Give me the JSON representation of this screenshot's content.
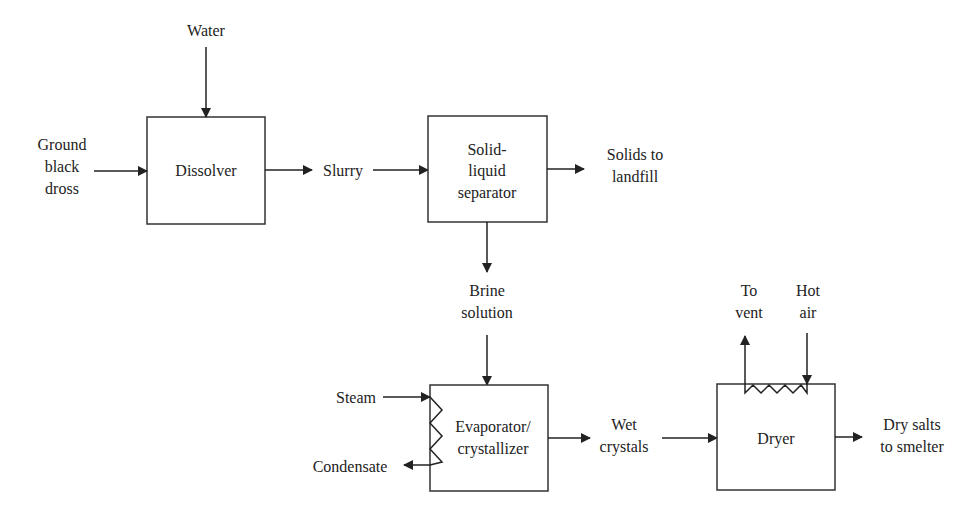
{
  "diagram": {
    "type": "process-flow",
    "units": {
      "dissolver": "Dissolver",
      "separator": [
        "Solid-",
        "liquid",
        "separator"
      ],
      "evaporator": [
        "Evaporator/",
        "crystallizer"
      ],
      "dryer": "Dryer"
    },
    "streams": {
      "water": "Water",
      "ground_black_dross": [
        "Ground",
        "black",
        "dross"
      ],
      "slurry": "Slurry",
      "solids_to_landfill": [
        "Solids to",
        "landfill"
      ],
      "brine_solution": [
        "Brine",
        "solution"
      ],
      "steam": "Steam",
      "condensate": "Condensate",
      "wet_crystals": [
        "Wet",
        "crystals"
      ],
      "to_vent": [
        "To",
        "vent"
      ],
      "hot_air": [
        "Hot",
        "air"
      ],
      "dry_salts": [
        "Dry salts",
        "to smelter"
      ]
    },
    "edges": [
      {
        "from": "Water",
        "to": "Dissolver"
      },
      {
        "from": "Ground black dross",
        "to": "Dissolver"
      },
      {
        "from": "Dissolver",
        "to": "Slurry"
      },
      {
        "from": "Slurry",
        "to": "Solid-liquid separator"
      },
      {
        "from": "Solid-liquid separator",
        "to": "Solids to landfill"
      },
      {
        "from": "Solid-liquid separator",
        "to": "Brine solution"
      },
      {
        "from": "Brine solution",
        "to": "Evaporator/crystallizer"
      },
      {
        "from": "Steam",
        "to": "Evaporator/crystallizer"
      },
      {
        "from": "Evaporator/crystallizer",
        "to": "Condensate"
      },
      {
        "from": "Evaporator/crystallizer",
        "to": "Wet crystals"
      },
      {
        "from": "Wet crystals",
        "to": "Dryer"
      },
      {
        "from": "Hot air",
        "to": "Dryer"
      },
      {
        "from": "Dryer",
        "to": "To vent"
      },
      {
        "from": "Dryer",
        "to": "Dry salts to smelter"
      }
    ]
  }
}
